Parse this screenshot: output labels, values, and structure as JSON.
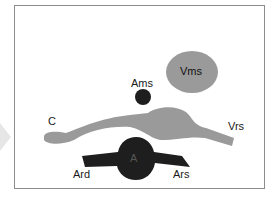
{
  "diagram": {
    "type": "anatomical cross-section schematic",
    "colors": {
      "frame": "#8c8c8c",
      "vein_fill": "#9a9a9a",
      "artery_fill": "#1e1e1e",
      "side_arrow": "#e6e6e6",
      "background": "#ffffff"
    },
    "labels": {
      "vms": "Vms",
      "ams": "Ams",
      "c": "C",
      "vrs": "Vrs",
      "a": "A",
      "ard": "Ard",
      "ars": "Ars"
    }
  }
}
